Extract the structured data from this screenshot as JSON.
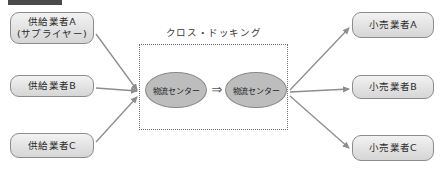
{
  "diagram": {
    "title_bar": "",
    "region": {
      "label": "クロス・ドッキング",
      "hubs": [
        {
          "id": "hub-in",
          "label": "物流センター"
        },
        {
          "id": "hub-out",
          "label": "物流センター"
        }
      ],
      "inner_arrow": "⇒"
    },
    "suppliers": [
      {
        "id": "supplier-a",
        "line1": "供給業者A",
        "line2": "(サプライヤー)"
      },
      {
        "id": "supplier-b",
        "line1": "供給業者B",
        "line2": ""
      },
      {
        "id": "supplier-c",
        "line1": "供給業者C",
        "line2": ""
      }
    ],
    "retailers": [
      {
        "id": "retailer-a",
        "line1": "小売業者A"
      },
      {
        "id": "retailer-b",
        "line1": "小売業者B"
      },
      {
        "id": "retailer-c",
        "line1": "小売業者C"
      }
    ],
    "colors": {
      "box_border": "#8c8c8c",
      "box_fill": "#e4e4e4",
      "hub_fill": "#bdbdbd",
      "arrow": "#8d8d8d",
      "dotted_border": "#6e6e6e",
      "text": "#2b2b2b",
      "heading_bar": "#4a4a4a"
    }
  }
}
